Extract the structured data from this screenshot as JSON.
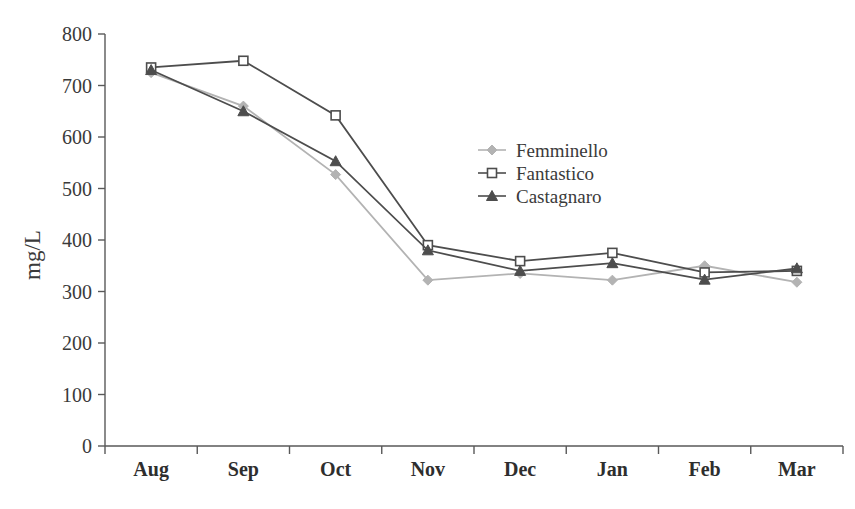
{
  "chart_data": {
    "type": "line",
    "title": "",
    "xlabel": "",
    "ylabel": "mg/L",
    "categories": [
      "Aug",
      "Sep",
      "Oct",
      "Nov",
      "Dec",
      "Jan",
      "Feb",
      "Mar"
    ],
    "ylim": [
      0,
      800
    ],
    "ytick_step": 100,
    "yticks": [
      "0",
      "100",
      "200",
      "300",
      "400",
      "500",
      "600",
      "700",
      "800"
    ],
    "grid": false,
    "legend_position": "center-right-upper",
    "series": [
      {
        "name": "Femminello",
        "color": "#b3b3b3",
        "marker": "diamond",
        "values": [
          725,
          660,
          527,
          322,
          335,
          322,
          350,
          318
        ]
      },
      {
        "name": "Fantastico",
        "color": "#4d4d4d",
        "marker": "open-square",
        "values": [
          735,
          748,
          642,
          390,
          359,
          375,
          337,
          340
        ]
      },
      {
        "name": "Castagnaro",
        "color": "#4d4d4d",
        "marker": "triangle",
        "values": [
          730,
          650,
          553,
          380,
          340,
          355,
          323,
          345
        ]
      }
    ]
  },
  "axis": {
    "y_label": "mg/L"
  },
  "legend": {
    "items": [
      {
        "label": "Femminello"
      },
      {
        "label": "Fantastico"
      },
      {
        "label": "Castagnaro"
      }
    ]
  }
}
